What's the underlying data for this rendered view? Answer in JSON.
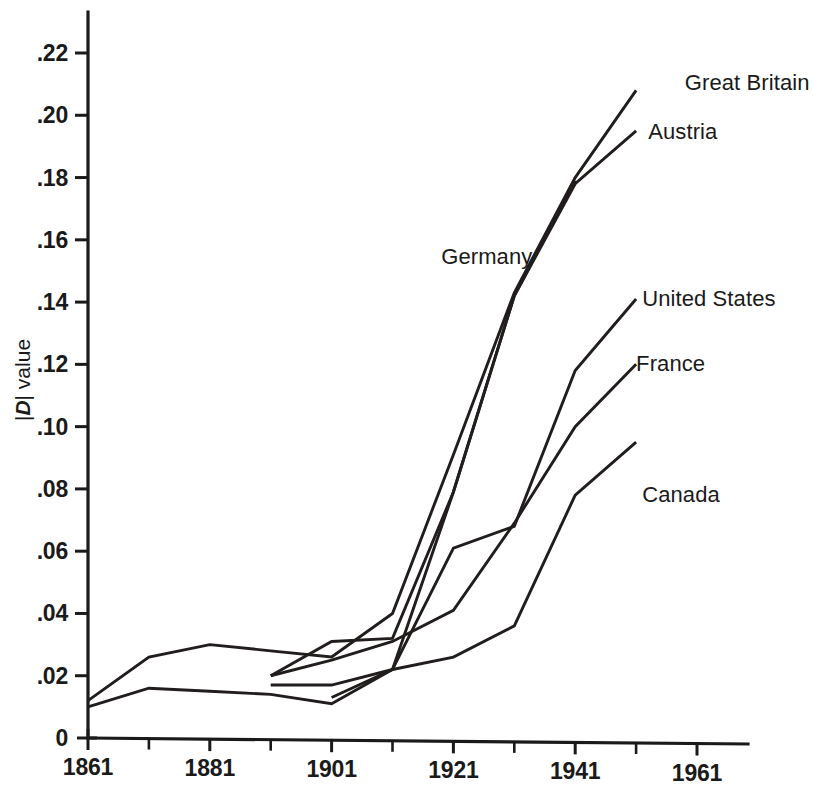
{
  "chart_data": {
    "type": "line",
    "title": "",
    "xlabel": "",
    "ylabel": "|D| value",
    "ylabel_parts": {
      "bar_left": "|",
      "italic_d": "D",
      "bar_right": "|",
      "word": " value"
    },
    "xlim": [
      1861,
      1971
    ],
    "ylim": [
      0,
      0.23
    ],
    "grid": false,
    "legend_position": "inline-right",
    "y_ticks": [
      0,
      0.02,
      0.04,
      0.06,
      0.08,
      0.1,
      0.12,
      0.14,
      0.16,
      0.18,
      0.2,
      0.22
    ],
    "y_tick_labels": [
      "0",
      ".02",
      ".04",
      ".06",
      ".08",
      ".10",
      ".12",
      ".14",
      ".16",
      ".18",
      ".20",
      ".22"
    ],
    "x_ticks": [
      1861,
      1881,
      1901,
      1921,
      1941,
      1961
    ],
    "x_tick_labels": [
      "1861",
      "1881",
      "1901",
      "1921",
      "1941",
      "1961"
    ],
    "x_minor_ticks": [
      1871,
      1891,
      1911,
      1931,
      1951
    ],
    "series": [
      {
        "name": "Great Britain",
        "label": "Great Britain",
        "label_x": 1959,
        "label_y": 0.2105,
        "x": [
          1861,
          1871,
          1881,
          1891,
          1901,
          1911,
          1921,
          1931,
          1941,
          1951
        ],
        "y": [
          0.012,
          0.026,
          0.03,
          0.028,
          0.026,
          0.04,
          0.091,
          0.143,
          0.18,
          0.208
        ]
      },
      {
        "name": "Austria",
        "label": "Austria",
        "label_x": 1953,
        "label_y": 0.1945,
        "x": [
          1891,
          1901,
          1911,
          1921,
          1931,
          1941,
          1951
        ],
        "y": [
          0.02,
          0.031,
          0.032,
          0.079,
          0.142,
          0.178,
          0.195
        ]
      },
      {
        "name": "Germany",
        "label": "Germany",
        "label_x": 1919,
        "label_y": 0.1545,
        "x": [
          1901,
          1911,
          1921,
          1931,
          1941
        ],
        "y": [
          0.013,
          0.022,
          0.079,
          0.142,
          0.179
        ]
      },
      {
        "name": "United States",
        "label": "United States",
        "label_x": 1952,
        "label_y": 0.141,
        "x": [
          1861,
          1871,
          1881,
          1891,
          1901,
          1911,
          1921,
          1931,
          1941,
          1951
        ],
        "y": [
          0.01,
          0.016,
          0.015,
          0.014,
          0.011,
          0.022,
          0.061,
          0.068,
          0.118,
          0.141
        ]
      },
      {
        "name": "France",
        "label": "France",
        "label_x": 1951,
        "label_y": 0.12,
        "x": [
          1891,
          1901,
          1911,
          1921,
          1931,
          1941,
          1951
        ],
        "y": [
          0.02,
          0.025,
          0.031,
          0.041,
          0.069,
          0.1,
          0.12
        ]
      },
      {
        "name": "Canada",
        "label": "Canada",
        "label_x": 1952,
        "label_y": 0.078,
        "x": [
          1891,
          1901,
          1911,
          1921,
          1931,
          1941,
          1951
        ],
        "y": [
          0.017,
          0.017,
          0.022,
          0.026,
          0.036,
          0.078,
          0.095
        ]
      }
    ]
  },
  "colors": {
    "line": "#201d1c",
    "axis": "#1a1a1a",
    "background": "#ffffff"
  }
}
